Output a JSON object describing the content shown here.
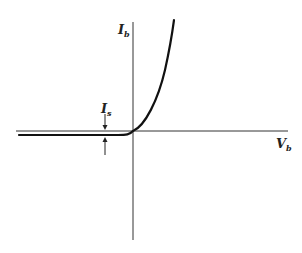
{
  "diagram": {
    "type": "diode I-V characteristic",
    "axes": {
      "y_label": {
        "main": "I",
        "sub": "b"
      },
      "x_label": {
        "main": "V",
        "sub": "b"
      }
    },
    "annotation": {
      "label": {
        "main": "I",
        "sub": "s"
      },
      "meaning": "reverse saturation current offset indicated by opposing arrows"
    },
    "colors": {
      "stroke": "#1a1a1a",
      "background": "#ffffff"
    }
  }
}
